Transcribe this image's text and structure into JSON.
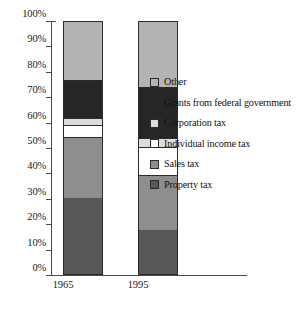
{
  "chart_data": {
    "type": "bar",
    "subtype": "stacked-100-percent",
    "title": "",
    "xlabel": "",
    "ylabel": "",
    "categories": [
      "1965",
      "1995"
    ],
    "ylim": [
      0,
      100
    ],
    "yticks": [
      "0%",
      "10%",
      "20%",
      "30%",
      "40%",
      "50%",
      "60%",
      "70%",
      "80%",
      "90%",
      "100%"
    ],
    "ytick_values": [
      0,
      10,
      20,
      30,
      40,
      50,
      60,
      70,
      80,
      90,
      100
    ],
    "grid": false,
    "legend_position": "right",
    "series": [
      {
        "name": "Other",
        "color": "#b4b4b4",
        "values": [
          23.5,
          26.5
        ]
      },
      {
        "name": "Grants from federal government",
        "color": "#262626",
        "values": [
          15.0,
          20.0
        ]
      },
      {
        "name": "Corporation tax",
        "color": "#dcdcdc",
        "values": [
          3.0,
          3.5
        ]
      },
      {
        "name": "Individual income tax",
        "color": "#ffffff",
        "values": [
          4.5,
          11.0
        ]
      },
      {
        "name": "Sales tax",
        "color": "#8e8e8e",
        "values": [
          24.0,
          21.5
        ]
      },
      {
        "name": "Property tax",
        "color": "#585858",
        "values": [
          30.0,
          17.5
        ]
      }
    ],
    "stack_order_bottom_to_top": [
      "Property tax",
      "Sales tax",
      "Individual income tax",
      "Corporation tax",
      "Grants from federal government",
      "Other"
    ]
  },
  "legend": {
    "items": [
      {
        "label": "Other",
        "color": "#b4b4b4"
      },
      {
        "label": "Grants from federal government",
        "color": "#262626"
      },
      {
        "label": "Corporation tax",
        "color": "#dcdcdc"
      },
      {
        "label": "Individual income tax",
        "color": "#ffffff"
      },
      {
        "label": "Sales tax",
        "color": "#8e8e8e"
      },
      {
        "label": "Property tax",
        "color": "#585858"
      }
    ]
  },
  "axis": {
    "y_ticks": [
      "100%",
      "90%",
      "80%",
      "70%",
      "60%",
      "50%",
      "40%",
      "30%",
      "20%",
      "10%",
      "0%"
    ],
    "x_labels": [
      "1965",
      "1995"
    ]
  }
}
